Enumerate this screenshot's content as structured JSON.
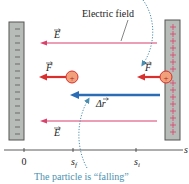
{
  "labels": {
    "electric_field": "Electric field",
    "E_top": "E",
    "E_bottom": "E",
    "F_left": "F",
    "F_right": "F",
    "delta_r": "Δr",
    "axis_var": "s",
    "tick_zero": "0",
    "tick_sf": "s",
    "tick_sf_sub": "f",
    "tick_si": "s",
    "tick_si_sub": "i",
    "charge_symbol": "+",
    "caption": "The particle is “falling”"
  },
  "plates": {
    "left": {
      "charge": "negative",
      "sign": "–"
    },
    "right": {
      "charge": "positive",
      "sign": "+"
    }
  },
  "colors": {
    "field_arrow": "#d9416b",
    "force_arrow": "#d9302e",
    "displacement_arrow": "#2a6db5",
    "charge_fill": "#f0a07a",
    "charge_stroke": "#d9302e",
    "plate_fill": "#b8bcb8",
    "plate_stroke": "#555555",
    "caption": "#4a8fb0",
    "dotted": "#4a8fb0",
    "axis": "#333333"
  }
}
